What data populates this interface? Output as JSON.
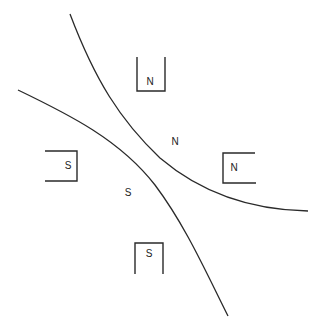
{
  "diagram": {
    "colors": {
      "background": "#ffffff",
      "stroke": "#2a2a2a",
      "text": "#222222"
    },
    "field_lines": [
      {
        "name": "upper-right-field-line",
        "path": "M 70 14 C 95 80, 120 120, 160 158 C 200 192, 250 210, 308 211"
      },
      {
        "name": "lower-left-field-line",
        "path": "M 18 90 C 70 115, 120 140, 155 185 C 185 225, 205 270, 228 316"
      }
    ],
    "magnets": [
      {
        "name": "top-magnet",
        "label": "N",
        "path": "M 137 57 L 137 91 L 165 91 L 165 57",
        "label_x": 150,
        "label_y": 85
      },
      {
        "name": "right-magnet",
        "label": "N",
        "path": "M 255 153 L 223 153 L 223 183 L 256 183",
        "label_x": 234,
        "label_y": 171
      },
      {
        "name": "left-magnet",
        "label": "S",
        "path": "M 45 151 L 77 151 L 77 181 L 45 181",
        "label_x": 68,
        "label_y": 169
      },
      {
        "name": "bottom-magnet",
        "label": "S",
        "path": "M 135 274 L 135 243 L 163 243 L 163 274",
        "label_x": 149,
        "label_y": 257
      }
    ],
    "region_labels": [
      {
        "name": "north-region-label",
        "text": "N",
        "x": 175,
        "y": 145
      },
      {
        "name": "south-region-label",
        "text": "S",
        "x": 128,
        "y": 196
      }
    ]
  }
}
